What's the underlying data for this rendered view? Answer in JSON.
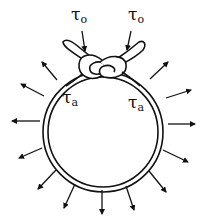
{
  "diagram": {
    "labels": {
      "tau_o_left": {
        "symbol": "τ",
        "subscript": "o"
      },
      "tau_o_right": {
        "symbol": "τ",
        "subscript": "o"
      },
      "tau_a_left": {
        "symbol": "τ",
        "subscript": "a"
      },
      "tau_a_right": {
        "symbol": "τ",
        "subscript": "a"
      }
    },
    "arrow_count": 14,
    "colors": {
      "ink": "#111111",
      "background": "#ffffff"
    }
  }
}
